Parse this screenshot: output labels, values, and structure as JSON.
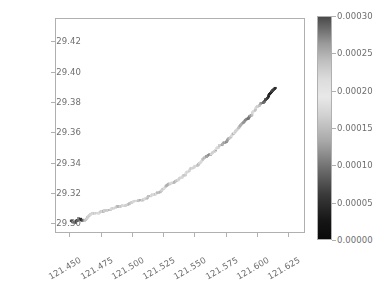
{
  "chart_data": {
    "type": "scatter",
    "title": "",
    "xlabel": "",
    "ylabel": "",
    "xlim": [
      121.4385,
      121.6385
    ],
    "ylim": [
      29.2935,
      29.4355
    ],
    "xticks": [
      "121.450",
      "121.475",
      "121.500",
      "121.525",
      "121.550",
      "121.575",
      "121.600",
      "121.625"
    ],
    "xtick_values": [
      121.45,
      121.475,
      121.5,
      121.525,
      121.55,
      121.575,
      121.6,
      121.625
    ],
    "yticks": [
      "29.30",
      "29.32",
      "29.34",
      "29.36",
      "29.38",
      "29.40",
      "29.42"
    ],
    "ytick_values": [
      29.3,
      29.32,
      29.34,
      29.36,
      29.38,
      29.4,
      29.42
    ],
    "grid": false,
    "legend": null,
    "marker": "square",
    "marker_size_px": 2,
    "colorbar": {
      "position": "right",
      "ticks": [
        "0.00000",
        "0.00005",
        "0.00010",
        "0.00015",
        "0.00020",
        "0.00025",
        "0.00030"
      ],
      "tick_values": [
        0.0,
        5e-05,
        0.0001,
        0.00015,
        0.0002,
        0.00025,
        0.0003
      ],
      "vmin": 0.0,
      "vmax": 0.0003,
      "cmap": "grayscale-diverging",
      "low_color": "#0a0a0a",
      "mid_color": "#e8e8e8",
      "high_color": "#4a4a4a"
    },
    "series": [
      {
        "name": "track",
        "x": [
          121.4505,
          121.4512,
          121.4519,
          121.4526,
          121.4533,
          121.454,
          121.4547,
          121.4554,
          121.456,
          121.4566,
          121.4572,
          121.4578,
          121.4583,
          121.4588,
          121.4593,
          121.4598,
          121.4603,
          121.4609,
          121.4615,
          121.4622,
          121.4629,
          121.4637,
          121.4645,
          121.4654,
          121.4663,
          121.4672,
          121.4681,
          121.469,
          121.4699,
          121.4708,
          121.4717,
          121.4726,
          121.4735,
          121.4744,
          121.4753,
          121.4762,
          121.4771,
          121.478,
          121.479,
          121.48,
          121.481,
          121.482,
          121.483,
          121.4841,
          121.4852,
          121.4863,
          121.4874,
          121.4885,
          121.4896,
          121.4907,
          121.4918,
          121.4929,
          121.494,
          121.4951,
          121.4962,
          121.4973,
          121.4984,
          121.4995,
          121.5006,
          121.5017,
          121.5028,
          121.5039,
          121.505,
          121.5061,
          121.5072,
          121.5083,
          121.5094,
          121.5105,
          121.5116,
          121.5127,
          121.5138,
          121.5149,
          121.516,
          121.5171,
          121.5181,
          121.5191,
          121.5201,
          121.5211,
          121.5221,
          121.5231,
          121.524,
          121.5249,
          121.5258,
          121.5267,
          121.5276,
          121.5285,
          121.5294,
          121.5303,
          121.5312,
          121.5321,
          121.533,
          121.5339,
          121.5348,
          121.5357,
          121.5366,
          121.5375,
          121.5384,
          121.5393,
          121.5402,
          121.5411,
          121.542,
          121.5429,
          121.5438,
          121.5447,
          121.5456,
          121.5465,
          121.5474,
          121.5483,
          121.5492,
          121.5501,
          121.551,
          121.5519,
          121.5528,
          121.5537,
          121.5546,
          121.5555,
          121.5564,
          121.5573,
          121.5582,
          121.5591,
          121.56,
          121.5609,
          121.5618,
          121.5627,
          121.5636,
          121.5645,
          121.5654,
          121.5663,
          121.5672,
          121.5681,
          121.569,
          121.5699,
          121.5708,
          121.5717,
          121.5726,
          121.5735,
          121.5744,
          121.5753,
          121.5762,
          121.5771,
          121.578,
          121.5789,
          121.5798,
          121.5807,
          121.5816,
          121.5825,
          121.5834,
          121.5843,
          121.5852,
          121.5861,
          121.587,
          121.5879,
          121.5888,
          121.5897,
          121.5906,
          121.5915,
          121.5924,
          121.5933,
          121.5942,
          121.5951,
          121.596,
          121.5969,
          121.5978,
          121.5987,
          121.5996,
          121.6005,
          121.6014,
          121.6023,
          121.6032,
          121.6041,
          121.605,
          121.6059,
          121.6068,
          121.6077,
          121.6086,
          121.6095,
          121.6104,
          121.6113,
          121.6122,
          121.6131,
          121.614,
          121.6148,
          121.6156
        ],
        "y": [
          29.3005,
          29.3002,
          29.3,
          29.2999,
          29.3,
          29.3003,
          29.3008,
          29.3013,
          29.3018,
          29.3021,
          29.3022,
          29.3021,
          29.3019,
          29.3017,
          29.3015,
          29.3014,
          29.3014,
          29.3016,
          29.3019,
          29.3023,
          29.3028,
          29.3033,
          29.3038,
          29.3043,
          29.3048,
          29.3053,
          29.3057,
          29.306,
          29.3062,
          29.3063,
          29.3063,
          29.3064,
          29.3066,
          29.3068,
          29.307,
          29.3072,
          29.3074,
          29.3076,
          29.3078,
          29.308,
          29.3083,
          29.3086,
          29.3089,
          29.3092,
          29.3095,
          29.3098,
          29.31,
          29.3102,
          29.3104,
          29.3106,
          29.3108,
          29.3111,
          29.3114,
          29.3117,
          29.312,
          29.3123,
          29.3126,
          29.3129,
          29.3132,
          29.3135,
          29.3138,
          29.3141,
          29.3144,
          29.3147,
          29.315,
          29.3153,
          29.3156,
          29.3159,
          29.3162,
          29.3166,
          29.317,
          29.3174,
          29.3178,
          29.3182,
          29.3187,
          29.3192,
          29.3197,
          29.3202,
          29.3207,
          29.3212,
          29.3218,
          29.3224,
          29.323,
          29.3236,
          29.3242,
          29.3248,
          29.3253,
          29.3257,
          29.3261,
          29.3264,
          29.3266,
          29.3268,
          29.3271,
          29.3275,
          29.328,
          29.3286,
          29.3292,
          29.3298,
          29.3304,
          29.331,
          29.3316,
          29.3322,
          29.3328,
          29.3334,
          29.334,
          29.3346,
          29.3352,
          29.3358,
          29.3364,
          29.337,
          29.3376,
          29.3382,
          29.3388,
          29.3394,
          29.34,
          29.3406,
          29.3412,
          29.3418,
          29.3424,
          29.343,
          29.3436,
          29.3442,
          29.3448,
          29.3454,
          29.346,
          29.3466,
          29.3472,
          29.3478,
          29.3484,
          29.349,
          29.3496,
          29.3502,
          29.3508,
          29.3514,
          29.352,
          29.3526,
          29.3532,
          29.3538,
          29.3545,
          29.3552,
          29.356,
          29.3568,
          29.3576,
          29.3584,
          29.3592,
          29.36,
          29.3608,
          29.3616,
          29.3624,
          29.3632,
          29.364,
          29.3648,
          29.3656,
          29.3664,
          29.3672,
          29.368,
          29.3688,
          29.3696,
          29.3704,
          29.3712,
          29.372,
          29.3728,
          29.3736,
          29.3744,
          29.3752,
          29.376,
          29.3768,
          29.3776,
          29.3784,
          29.3792,
          29.38,
          29.3808,
          29.3816,
          29.3824,
          29.3832,
          29.384,
          29.3848,
          29.3856,
          29.3864,
          29.3872,
          29.388,
          29.3888,
          29.3896
        ],
        "values": [
          4e-05,
          6e-05,
          9e-05,
          0.00011,
          9e-05,
          7e-05,
          5e-05,
          4e-05,
          6e-05,
          9e-05,
          0.00012,
          0.0001,
          7e-05,
          5e-05,
          3e-05,
          4e-05,
          7e-05,
          0.00011,
          0.00014,
          0.00017,
          0.00019,
          0.0002,
          0.00021,
          0.0002,
          0.00019,
          0.00018,
          0.00019,
          0.0002,
          0.00021,
          0.0002,
          0.00019,
          0.00018,
          0.00019,
          0.0002,
          0.00021,
          0.00022,
          0.00021,
          0.0002,
          0.00019,
          0.00018,
          0.00017,
          0.00016,
          0.00017,
          0.00018,
          0.00019,
          0.0002,
          0.00021,
          0.00022,
          0.00021,
          0.0002,
          0.00019,
          0.00018,
          0.00017,
          0.00018,
          0.00019,
          0.0002,
          0.00021,
          0.0002,
          0.00019,
          0.00018,
          0.00019,
          0.0002,
          0.00021,
          0.00022,
          0.00021,
          0.0002,
          0.00019,
          0.00018,
          0.00017,
          0.00016,
          0.00015,
          0.00016,
          0.00017,
          0.00018,
          0.00019,
          0.0002,
          0.00021,
          0.00022,
          0.00021,
          0.0002,
          0.00019,
          0.00018,
          0.00017,
          0.00016,
          0.00015,
          0.00014,
          0.00013,
          0.00014,
          0.00016,
          0.00018,
          0.0002,
          0.00021,
          0.00022,
          0.00021,
          0.0002,
          0.00019,
          0.00018,
          0.00017,
          0.00018,
          0.00019,
          0.0002,
          0.00021,
          0.0002,
          0.00019,
          0.00018,
          0.00017,
          0.00016,
          0.00017,
          0.00018,
          0.00019,
          0.0002,
          0.00021,
          0.00022,
          0.00021,
          0.0002,
          0.00019,
          0.00018,
          0.00017,
          0.00016,
          0.00015,
          0.00014,
          0.00013,
          0.00012,
          0.00013,
          0.00015,
          0.00017,
          0.00019,
          0.0002,
          0.00021,
          0.0002,
          0.00019,
          0.00018,
          0.00017,
          0.00016,
          0.00015,
          0.00014,
          0.00013,
          0.00012,
          0.00011,
          0.00012,
          0.00014,
          0.00016,
          0.00018,
          0.0002,
          0.00021,
          0.0002,
          0.00019,
          0.00018,
          0.00017,
          0.00016,
          0.00015,
          0.00014,
          0.00013,
          0.00012,
          0.00011,
          0.0001,
          9e-05,
          8e-05,
          9e-05,
          0.00011,
          0.00013,
          0.00015,
          0.00017,
          0.00019,
          0.0002,
          0.00019,
          0.00018,
          0.00016,
          0.00014,
          0.00012,
          0.0001,
          8e-05,
          6e-05,
          5e-05,
          4e-05,
          3e-05,
          2e-05,
          2e-05,
          3e-05,
          4e-05,
          5e-05,
          4e-05,
          3e-05
        ]
      }
    ]
  }
}
